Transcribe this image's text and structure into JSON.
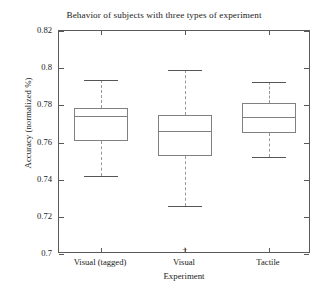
{
  "chart_data": {
    "type": "box",
    "title": "Behavior of subjects with three types of experiment",
    "xlabel": "Experiment",
    "ylabel": "Accuracy (normalized %)",
    "ylim": [
      0.7,
      0.82
    ],
    "yticks": [
      "0.7",
      "0.72",
      "0.74",
      "0.76",
      "0.78",
      "0.8",
      "0.82"
    ],
    "ytick_values": [
      0.7,
      0.72,
      0.74,
      0.76,
      0.78,
      0.8,
      0.82
    ],
    "grid": false,
    "legend": "none",
    "categories": [
      "Visual (tagged)",
      "Visual",
      "Tactile"
    ],
    "boxes": [
      {
        "category": "Visual (tagged)",
        "whisker_low": 0.7419,
        "q1": 0.7606,
        "median": 0.7742,
        "q3": 0.7785,
        "whisker_high": 0.7935,
        "outliers": []
      },
      {
        "category": "Visual",
        "whisker_low": 0.7258,
        "q1": 0.7525,
        "median": 0.7661,
        "q3": 0.7747,
        "whisker_high": 0.799,
        "outliers": [
          0.7022
        ]
      },
      {
        "category": "Tactile",
        "whisker_low": 0.7521,
        "q1": 0.7652,
        "median": 0.7735,
        "q3": 0.7812,
        "whisker_high": 0.7925,
        "outliers": []
      }
    ],
    "colors": {
      "axis": "#595959",
      "box_edge": "#808080",
      "median": "#808080",
      "whisker": "#999999",
      "cap": "#555555",
      "outlier": "#555555",
      "background": "#ffffff"
    },
    "outlier_marker": "+"
  }
}
